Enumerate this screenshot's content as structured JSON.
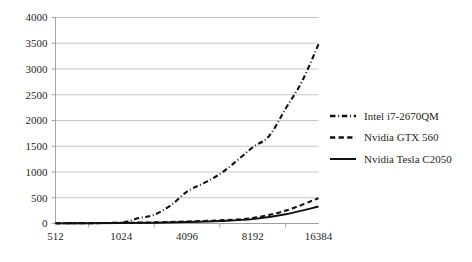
{
  "chart_data": {
    "type": "line",
    "title": "",
    "subtitle": "",
    "xlabel": "",
    "ylabel": "",
    "grid": true,
    "legend_position": "right",
    "x_axis_scale": "categorical",
    "categories": [
      "512",
      "1024",
      "2048",
      "4096",
      "8192",
      "16384"
    ],
    "xticklabels": [
      "512",
      "1024",
      "4096",
      "8192",
      "16384"
    ],
    "xtick_positions": [
      0,
      1,
      2,
      3,
      4
    ],
    "yticklabels": [
      "0",
      "500",
      "1000",
      "1500",
      "2000",
      "2500",
      "3000",
      "3500",
      "4000"
    ],
    "ylim": [
      0,
      4000
    ],
    "ytick_step": 500,
    "series": [
      {
        "name": "Intel i7-2670QM",
        "linestyle": "dashdot",
        "color": "#111111",
        "x": [
          0,
          0.5,
          1,
          1.25,
          1.5,
          1.75,
          2,
          2.25,
          2.5,
          2.75,
          3,
          3.25,
          3.5,
          3.75,
          4
        ],
        "values": [
          5,
          10,
          20,
          100,
          170,
          350,
          620,
          780,
          960,
          1210,
          1480,
          1700,
          2230,
          2760,
          3480
        ]
      },
      {
        "name": "Nvidia GTX 560",
        "linestyle": "dashed",
        "color": "#111111",
        "x": [
          0,
          0.5,
          1,
          1.5,
          2,
          2.5,
          3,
          3.5,
          4
        ],
        "values": [
          4,
          7,
          12,
          22,
          40,
          62,
          105,
          250,
          490
        ]
      },
      {
        "name": "Nvidia Tesla C2050",
        "linestyle": "solid",
        "color": "#111111",
        "x": [
          0,
          0.5,
          1,
          1.5,
          2,
          2.5,
          3,
          3.5,
          4
        ],
        "values": [
          3,
          5,
          9,
          16,
          28,
          48,
          85,
          180,
          330
        ]
      }
    ]
  },
  "legend": {
    "entries": [
      {
        "label": "Intel i7-2670QM",
        "style": "dashdot"
      },
      {
        "label": "Nvidia GTX 560",
        "style": "dashed"
      },
      {
        "label": "Nvidia Tesla C2050",
        "style": "solid"
      }
    ]
  }
}
